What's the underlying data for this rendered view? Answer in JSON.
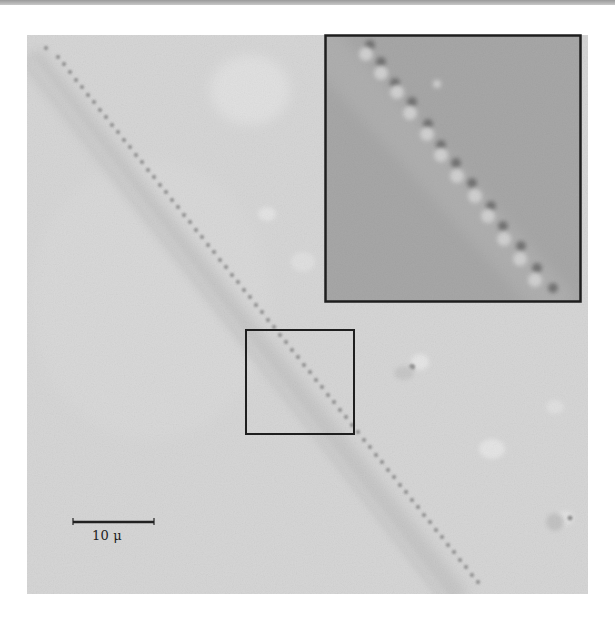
{
  "figure": {
    "scale_bar": {
      "label": "10 μ"
    },
    "colors": {
      "background": "#d6d6d6",
      "inset_background": "#a9a9a9",
      "frame": "#1e1e1e",
      "particle": "#555555"
    },
    "regions": {
      "micrograph": {
        "x": 27,
        "y": 35,
        "width": 561,
        "height": 559
      },
      "inset": {
        "x": 325,
        "y": 35,
        "width": 256,
        "height": 267
      },
      "selection_box": {
        "x": 245,
        "y": 329,
        "width": 109,
        "height": 105
      }
    }
  }
}
